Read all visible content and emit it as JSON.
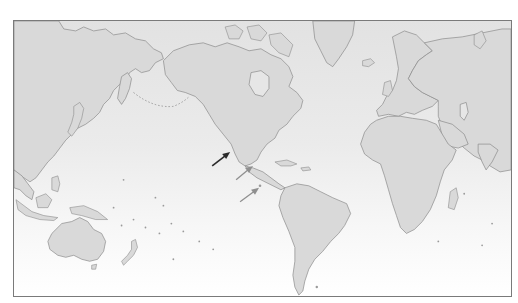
{
  "map": {
    "projection": "Pacific-centered world map (Mercator-like)",
    "colors": {
      "ocean_top": "#e4e4e4",
      "ocean_bottom": "#ffffff",
      "land": "#d9d9d9",
      "coastline": "#8a8a8a",
      "frame": "#7a7a7a",
      "arrow_primary": "#2b2b2b",
      "arrow_secondary": "#8f8f8f"
    },
    "arrows": [
      {
        "id": "arrow-1",
        "style": "dark",
        "target": "Pacific coast of Mexico (Baja California region)"
      },
      {
        "id": "arrow-2",
        "style": "light",
        "target": "Pacific coast of Central America"
      },
      {
        "id": "arrow-3",
        "style": "light",
        "target": "Galápagos Islands"
      }
    ],
    "regions": [
      "Asia",
      "Australia",
      "New Zealand",
      "North America",
      "Greenland",
      "South America",
      "Europe",
      "Africa",
      "Madagascar"
    ]
  }
}
